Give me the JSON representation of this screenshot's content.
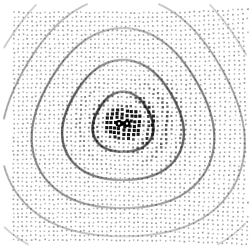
{
  "figure": {
    "title": "",
    "background_color": "#ffffff",
    "width": 250,
    "height": 249,
    "marker_shape": "square",
    "marker_base_size": 2.0,
    "marker_color_dark": "#111111",
    "marker_color_light": "#c9c9c9",
    "source_color": "#000000"
  },
  "chart_data": {
    "type": "scatter",
    "title": "",
    "subtitle": "",
    "xlabel": "",
    "ylabel": "",
    "xlim": [
      -1.0,
      1.0
    ],
    "ylim": [
      -1.0,
      1.0
    ],
    "grid": false,
    "legend": null,
    "xticks": [],
    "yticks": [],
    "description": "Deformed grid of square markers depicting a radiating dipole wave field; marker darkness encodes field magnitude.",
    "plot_area": {
      "x0": 13,
      "y0": 12,
      "x1": 241,
      "y1": 238
    },
    "grid_layout": {
      "nx": 52,
      "ny": 52,
      "spacing_px": 4.45,
      "origin_x": 14.0,
      "origin_y": 13.0
    },
    "source": {
      "name": "dipole",
      "center_x": 123.0,
      "center_y": 123.5,
      "lobe_offset_px": 4.0,
      "lobe_radius_px": 3.6,
      "color": "#000000"
    },
    "field": {
      "wavelength_px": 30.0,
      "decay_scale_px": 95.0,
      "amplitude": 1.0,
      "phase_offset": 0.0,
      "dipole_axis_deg": 0.0,
      "directivity_exponent": 1.0
    },
    "warp": {
      "shear_x_coeff": 0.085,
      "shear_y_coeff": 0.075,
      "swirl_coeff": 0.055,
      "radial_coeff": 0.045,
      "edge_falloff": 0.65
    },
    "arcs": [
      {
        "radius_px": 30,
        "opacity": 0.95
      },
      {
        "radius_px": 60,
        "opacity": 0.8
      },
      {
        "radius_px": 90,
        "opacity": 0.62
      },
      {
        "radius_px": 120,
        "opacity": 0.45
      },
      {
        "radius_px": 150,
        "opacity": 0.3
      }
    ],
    "points_note": "Points generated parametrically from grid_layout + warp; magnitude from field model."
  }
}
